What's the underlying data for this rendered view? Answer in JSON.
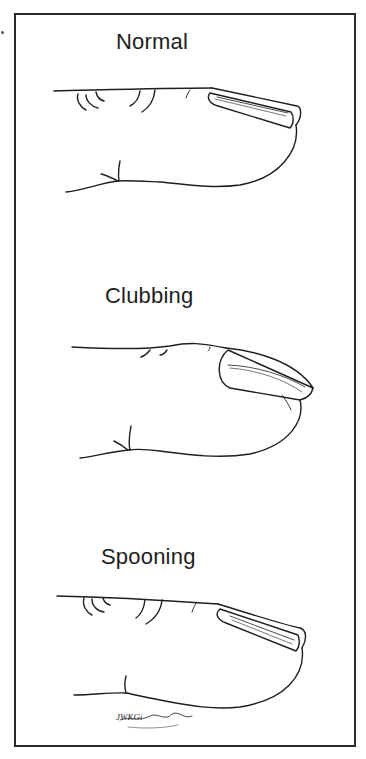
{
  "figure": {
    "panels": [
      {
        "label": "Normal"
      },
      {
        "label": "Clubbing"
      },
      {
        "label": "Spooning"
      }
    ],
    "signature": "JWKGi"
  },
  "colors": {
    "ink": "#1e1e1e",
    "border": "#2a2a2a",
    "background": "#ffffff"
  }
}
